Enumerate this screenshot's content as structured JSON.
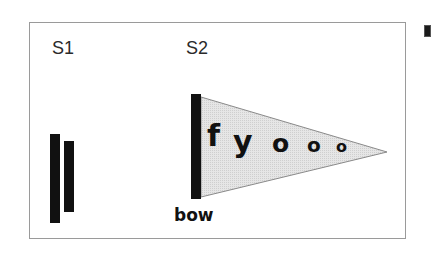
{
  "diagram": {
    "stages": [
      {
        "id": "s1",
        "label": "S1"
      },
      {
        "id": "s2",
        "label": "S2"
      }
    ],
    "s1_bars": [
      {
        "name": "tall-bar",
        "x": 50,
        "y": 134,
        "width": 10,
        "height": 89
      },
      {
        "name": "short-bar",
        "x": 64,
        "y": 141,
        "width": 10,
        "height": 71
      }
    ],
    "s2_mast": {
      "x": 191,
      "y": 94,
      "width": 10,
      "height": 105
    },
    "pennant": {
      "points": "201,97 387,152 201,197",
      "fill": "#e2e2e2",
      "stroke": "#8a8a8a",
      "letters": [
        {
          "char": "f",
          "x": 207,
          "y": 121,
          "size": 30
        },
        {
          "char": "y",
          "x": 233,
          "y": 127,
          "size": 30
        },
        {
          "char": "o",
          "x": 272,
          "y": 131,
          "size": 25
        },
        {
          "char": "o",
          "x": 307,
          "y": 135,
          "size": 20
        },
        {
          "char": "o",
          "x": 336,
          "y": 139,
          "size": 16
        }
      ]
    },
    "bow_label": "bow",
    "colors": {
      "ink": "#111111",
      "frame": "#9a9a9a",
      "pennant_fill": "#e2e2e2"
    }
  }
}
